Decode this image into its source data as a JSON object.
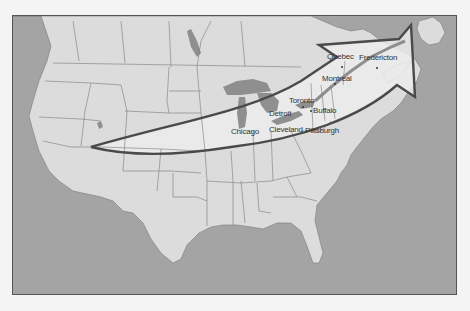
{
  "map": {
    "title": "",
    "colors": {
      "water": "#a4a4a4",
      "land": "#dcdcdc",
      "lakes": "#8f8f8f",
      "highlight_region": "#ececec",
      "arrow_outline": "#4a4a4a",
      "border_lines": "#7a7a7a"
    },
    "cities": [
      {
        "name": "Quebec",
        "x": 326,
        "y": 58
      },
      {
        "name": "Fredericton",
        "x": 359,
        "y": 59
      },
      {
        "name": "Montreal",
        "x": 322,
        "y": 74
      },
      {
        "name": "Toronto",
        "x": 289,
        "y": 96
      },
      {
        "name": "Buffalo",
        "x": 313,
        "y": 107
      },
      {
        "name": "Detroit",
        "x": 268,
        "y": 109
      },
      {
        "name": "Chicago",
        "x": 229,
        "y": 125
      },
      {
        "name": "Cleveland",
        "x": 268,
        "y": 125
      },
      {
        "name": "Pittsburgh",
        "x": 304,
        "y": 126
      }
    ],
    "arrow": {
      "description": "Curved arrow from the western United States sweeping northeast toward Atlantic Canada",
      "start": "Nevada/Utah region",
      "end": "Gulf of St. Lawrence / Atlantic"
    }
  }
}
